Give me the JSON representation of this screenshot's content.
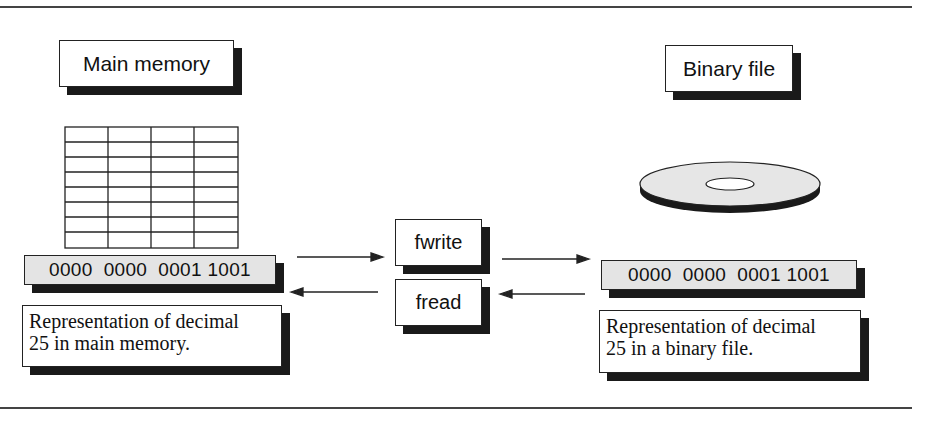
{
  "left": {
    "title": "Main memory",
    "binary_value": "0000  0000  0001 1001",
    "description_line1": "Representation of decimal",
    "description_line2": "25 in main memory.",
    "grid": {
      "columns": 4,
      "rows": 8
    }
  },
  "middle": {
    "write_label": "fwrite",
    "read_label": "fread"
  },
  "right": {
    "title": "Binary file",
    "binary_value": "0000  0000  0001 1001",
    "description_line1": "Representation of decimal",
    "description_line2": "25 in a binary file."
  },
  "colors": {
    "binary_fill": "#e4e4e4",
    "shadow": "#1a1a1a",
    "disk_fill": "#e6e6e6"
  }
}
